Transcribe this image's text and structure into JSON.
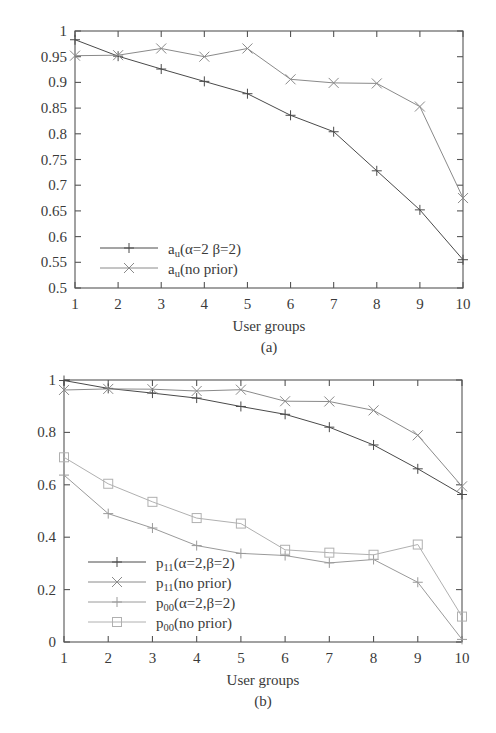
{
  "figure": {
    "background_color": "#ffffff",
    "ink_color": "#3a3a3a",
    "axis_color": "#555555"
  },
  "chart_data": [
    {
      "id": "panel-a",
      "type": "line",
      "title": "",
      "caption": "(a)",
      "xlabel": "User groups",
      "ylabel": "",
      "x": [
        1,
        2,
        3,
        4,
        5,
        6,
        7,
        8,
        9,
        10
      ],
      "xtick_labels": [
        "1",
        "2",
        "3",
        "4",
        "5",
        "6",
        "7",
        "8",
        "9",
        "10"
      ],
      "ytick_labels": [
        "0.5",
        "0.55",
        "0.6",
        "0.65",
        "0.7",
        "0.75",
        "0.8",
        "0.85",
        "0.9",
        "0.95",
        "1"
      ],
      "ytick_values": [
        0.5,
        0.55,
        0.6,
        0.65,
        0.7,
        0.75,
        0.8,
        0.85,
        0.9,
        0.95,
        1
      ],
      "xlim": [
        1,
        10
      ],
      "ylim": [
        0.5,
        1
      ],
      "grid": false,
      "legend_position": "bottom-left",
      "series": [
        {
          "name": "a_u(alpha=2 beta=2)",
          "legend_html": "a<sub>u</sub>(α=2 β=2)",
          "marker": "plus",
          "color": "#4a4a4a",
          "values": [
            0.983,
            0.951,
            0.926,
            0.902,
            0.878,
            0.836,
            0.804,
            0.728,
            0.652,
            0.555
          ]
        },
        {
          "name": "a_u(no prior)",
          "legend_html": "a<sub>u</sub>(no prior)",
          "marker": "cross",
          "color": "#8a8a8a",
          "values": [
            0.952,
            0.953,
            0.966,
            0.95,
            0.966,
            0.906,
            0.899,
            0.898,
            0.853,
            0.675
          ]
        }
      ]
    },
    {
      "id": "panel-b",
      "type": "line",
      "title": "",
      "caption": "(b)",
      "xlabel": "User groups",
      "ylabel": "",
      "x": [
        1,
        2,
        3,
        4,
        5,
        6,
        7,
        8,
        9,
        10
      ],
      "xtick_labels": [
        "1",
        "2",
        "3",
        "4",
        "5",
        "6",
        "7",
        "8",
        "9",
        "10"
      ],
      "ytick_labels": [
        "0",
        "0.2",
        "0.4",
        "0.6",
        "0.8",
        "1"
      ],
      "ytick_values": [
        0,
        0.2,
        0.4,
        0.6,
        0.8,
        1
      ],
      "xlim": [
        1,
        10
      ],
      "ylim": [
        0,
        1
      ],
      "grid": false,
      "legend_position": "bottom-left",
      "series": [
        {
          "name": "p11(alpha=2,beta=2)",
          "legend_html": "p<sub>11</sub>(α=2,β=2)",
          "marker": "plus",
          "color": "#4a4a4a",
          "values": [
            0.998,
            0.968,
            0.95,
            0.931,
            0.899,
            0.869,
            0.82,
            0.752,
            0.661,
            0.563
          ]
        },
        {
          "name": "p11(no prior)",
          "legend_html": "p<sub>11</sub>(no prior)",
          "marker": "cross",
          "color": "#8a8a8a",
          "values": [
            0.962,
            0.966,
            0.965,
            0.958,
            0.963,
            0.919,
            0.918,
            0.884,
            0.789,
            0.594
          ]
        },
        {
          "name": "p00(alpha=2,beta=2)",
          "legend_html": "p<sub>00</sub>(α=2,β=2)",
          "marker": "plus",
          "color": "#9a9a9a",
          "values": [
            0.637,
            0.49,
            0.435,
            0.368,
            0.338,
            0.33,
            0.302,
            0.315,
            0.228,
            0.01
          ]
        },
        {
          "name": "p00(no prior)",
          "legend_html": "p<sub>00</sub>(no prior)",
          "marker": "square",
          "color": "#b0b0b0",
          "values": [
            0.705,
            0.604,
            0.535,
            0.473,
            0.452,
            0.352,
            0.341,
            0.333,
            0.372,
            0.097
          ]
        }
      ]
    }
  ]
}
